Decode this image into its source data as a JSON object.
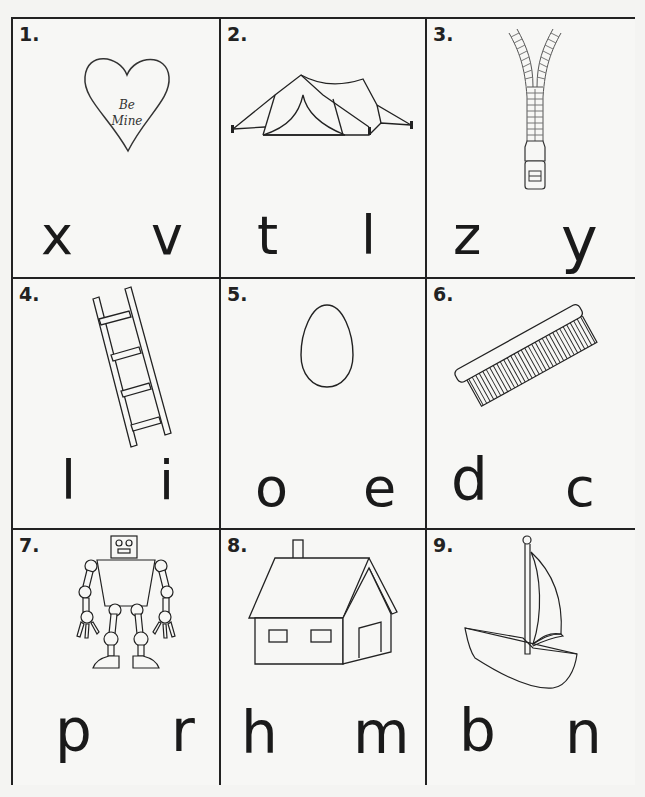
{
  "worksheet": {
    "cells": [
      {
        "number": "1.",
        "picture": "heart",
        "picture_text": [
          "Be",
          "Mine"
        ],
        "letters": [
          "x",
          "v"
        ]
      },
      {
        "number": "2.",
        "picture": "tent",
        "letters": [
          "t",
          "l"
        ]
      },
      {
        "number": "3.",
        "picture": "zipper",
        "letters": [
          "z",
          "y"
        ]
      },
      {
        "number": "4.",
        "picture": "ladder",
        "letters": [
          "l",
          "i"
        ]
      },
      {
        "number": "5.",
        "picture": "egg",
        "letters": [
          "o",
          "e"
        ]
      },
      {
        "number": "6.",
        "picture": "comb",
        "letters": [
          "d",
          "c"
        ]
      },
      {
        "number": "7.",
        "picture": "robot",
        "letters": [
          "p",
          "r"
        ]
      },
      {
        "number": "8.",
        "picture": "house",
        "letters": [
          "h",
          "m"
        ]
      },
      {
        "number": "9.",
        "picture": "sailboat",
        "letters": [
          "b",
          "n"
        ]
      }
    ]
  }
}
